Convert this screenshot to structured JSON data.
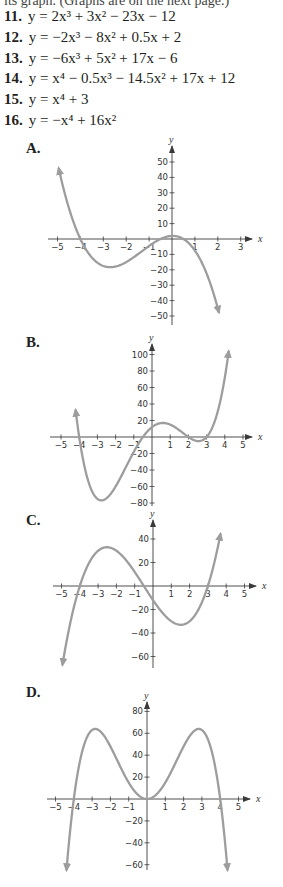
{
  "header": {
    "clipped_text": "its graph. (Graphs are on the next page.)"
  },
  "problems": [
    {
      "number": "11.",
      "equation": "y = 2x³ + 3x² − 23x − 12"
    },
    {
      "number": "12.",
      "equation": "y = −2x³ − 8x² + 0.5x + 2"
    },
    {
      "number": "13.",
      "equation": "y = −6x³ + 5x² + 17x − 6"
    },
    {
      "number": "14.",
      "equation": "y = x⁴ − 0.5x³ − 14.5x² + 17x + 12"
    },
    {
      "number": "15.",
      "equation": "y = x⁴ + 3"
    },
    {
      "number": "16.",
      "equation": "y = −x⁴ + 16x²"
    }
  ],
  "colors": {
    "curve": "#9d9d9d",
    "axis": "#3a3a3a",
    "text": "#231f20"
  },
  "graphs": [
    {
      "label": "A.",
      "top": 128,
      "height": 200,
      "origin_px": [
        172,
        111
      ],
      "x_unit_px": 22.9,
      "y_unit_px": 1.54,
      "x_axis_range_px": [
        48,
        252
      ],
      "y_axis_range_px": [
        18,
        197
      ],
      "x_ticks": [
        -5,
        -4,
        -3,
        -2,
        -1,
        1,
        2,
        3
      ],
      "y_ticks": [
        50,
        40,
        30,
        20,
        10,
        -10,
        -20,
        -30,
        -40,
        -50
      ],
      "x_domain": [
        -4.95,
        2.05
      ],
      "y_clip": [
        -52,
        52
      ],
      "coefficients": [
        -2,
        -8,
        0.5,
        2
      ],
      "axis_labels": {
        "x": "x",
        "y": "y"
      }
    },
    {
      "label": "B.",
      "top": 328,
      "height": 182,
      "origin_px": [
        152,
        109
      ],
      "x_unit_px": 18.2,
      "y_unit_px": 0.825,
      "x_axis_range_px": [
        50,
        252
      ],
      "y_axis_range_px": [
        16,
        178
      ],
      "x_ticks": [
        -5,
        -4,
        -3,
        -2,
        -1,
        1,
        2,
        3,
        4,
        5
      ],
      "y_ticks": [
        100,
        80,
        60,
        40,
        20,
        -20,
        -40,
        -60,
        -80
      ],
      "x_domain": [
        -4.2,
        4.25
      ],
      "y_clip": [
        -100,
        108
      ],
      "coefficients": [
        1,
        -0.5,
        -14.5,
        17,
        12
      ],
      "axis_labels": {
        "x": "x",
        "y": "y"
      }
    },
    {
      "label": "C.",
      "top": 510,
      "height": 172,
      "origin_px": [
        153,
        76
      ],
      "x_unit_px": 18.3,
      "y_unit_px": 1.175,
      "x_axis_range_px": [
        53,
        256
      ],
      "y_axis_range_px": [
        10,
        158
      ],
      "x_ticks": [
        -5,
        -4,
        -3,
        -2,
        -1,
        1,
        2,
        3,
        4,
        5
      ],
      "y_ticks": [
        40,
        20,
        -20,
        -40,
        -60
      ],
      "x_domain": [
        -4.95,
        3.8
      ],
      "y_clip": [
        -70,
        47
      ],
      "coefficients": [
        2,
        3,
        -23,
        -12
      ],
      "axis_labels": {
        "x": "x",
        "y": "y"
      }
    },
    {
      "label": "D.",
      "top": 682,
      "height": 205,
      "origin_px": [
        147,
        117
      ],
      "x_unit_px": 18.3,
      "y_unit_px": 1.095,
      "x_axis_range_px": [
        47,
        250
      ],
      "y_axis_range_px": [
        20,
        188
      ],
      "x_ticks": [
        -5,
        -4,
        -3,
        -2,
        -1,
        1,
        2,
        3,
        4,
        5
      ],
      "y_ticks": [
        80,
        60,
        40,
        20,
        -20,
        -40,
        -60
      ],
      "x_domain": [
        -4.4,
        4.4
      ],
      "y_clip": [
        -67,
        90
      ],
      "coefficients": [
        -1,
        0,
        16,
        0,
        0
      ],
      "axis_labels": {
        "x": "x",
        "y": "y"
      }
    }
  ]
}
